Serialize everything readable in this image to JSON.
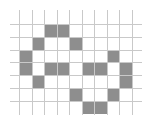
{
  "diagram": {
    "type": "pixel-grid",
    "colors": {
      "background": "#ffffff",
      "grid_line": "#c9c9c9",
      "fill": "#8e8e8e"
    },
    "vertical_lines_x": [
      19,
      32,
      44,
      57,
      69,
      82,
      94,
      107,
      119,
      132
    ],
    "vertical_line_span": [
      10,
      115
    ],
    "horizontal_lines_y": [
      24,
      37,
      50,
      62,
      75,
      88,
      101
    ],
    "horizontal_line_span": [
      10,
      142
    ],
    "row_bottom_y": 114,
    "filled_cells": [
      {
        "row": 0,
        "col": 2
      },
      {
        "row": 0,
        "col": 3
      },
      {
        "row": 1,
        "col": 1
      },
      {
        "row": 1,
        "col": 4
      },
      {
        "row": 2,
        "col": 0
      },
      {
        "row": 2,
        "col": 7
      },
      {
        "row": 3,
        "col": 0
      },
      {
        "row": 3,
        "col": 2
      },
      {
        "row": 3,
        "col": 3
      },
      {
        "row": 3,
        "col": 5
      },
      {
        "row": 3,
        "col": 6
      },
      {
        "row": 3,
        "col": 8
      },
      {
        "row": 4,
        "col": 1
      },
      {
        "row": 4,
        "col": 8
      },
      {
        "row": 5,
        "col": 4
      },
      {
        "row": 5,
        "col": 7
      },
      {
        "row": 6,
        "col": 5
      },
      {
        "row": 6,
        "col": 6
      }
    ]
  }
}
